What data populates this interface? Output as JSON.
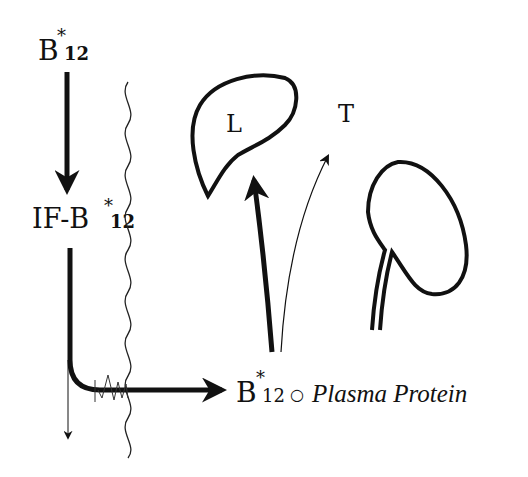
{
  "labels": {
    "b12_top": {
      "base": "B",
      "star": "*",
      "sub": "12"
    },
    "if_b12": {
      "prefix": "IF-B",
      "star": "*",
      "sub": "12"
    },
    "liver": "L",
    "tissue": "T",
    "product": {
      "base": "B",
      "star": "*",
      "sub": "12",
      "bond": "○",
      "protein": "Plasma Protein"
    }
  },
  "colors": {
    "ink": "#111111",
    "background": "#ffffff"
  }
}
